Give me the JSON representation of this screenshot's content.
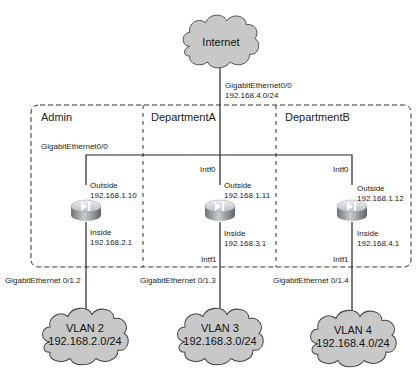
{
  "diagram": {
    "internet": {
      "label": "Internet",
      "link_interface": "GigabitEthernet0/0",
      "link_network": "192.168.4.0/24"
    },
    "areas": [
      {
        "name": "Admin",
        "uplink_label": "GigabitEthernet0/0",
        "router": {
          "outside_label": "Outside",
          "outside_ip": "192.168.1.10",
          "inside_label": "Inside",
          "inside_ip": "192.168.2.1"
        },
        "downlink_label": "GigabitEthernet 0/1.2",
        "vlan": {
          "name": "VLAN 2",
          "network": "192.168.2.0/24"
        }
      },
      {
        "name": "DepartmentA",
        "uplink_label": "Intf0",
        "router": {
          "outside_label": "Outside",
          "outside_ip": "192.168.1.11",
          "inside_label": "Inside",
          "inside_ip": "192.168.3.1"
        },
        "inside_intf_label": "Intf1",
        "downlink_label": "GigabitEthernet 0/1.3",
        "vlan": {
          "name": "VLAN 3",
          "network": "192.168.3.0/24"
        }
      },
      {
        "name": "DepartmentB",
        "uplink_label": "Intf0",
        "router": {
          "outside_label": "Outside",
          "outside_ip": "192.168.1.12",
          "inside_label": "Inside",
          "inside_ip": "192.168.4.1"
        },
        "inside_intf_label": "Intf1",
        "downlink_label": "GigabitEthernet 0/1.4",
        "vlan": {
          "name": "VLAN 4",
          "network": "192.168.4.0/24"
        }
      }
    ],
    "colors": {
      "cloud_fill": "#c8c8c8",
      "cloud_stroke": "#444444",
      "line": "#222222",
      "dash": "#333333",
      "router_top": "#d6d9dc",
      "router_side": "#8d9296"
    }
  }
}
